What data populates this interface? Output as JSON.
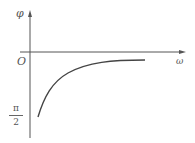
{
  "diagram": {
    "title": "",
    "y_axis_label": "φ",
    "x_axis_label": "ω",
    "origin_label": "O",
    "y_tick_label": {
      "numerator": "π",
      "denominator": "2"
    },
    "curve": {
      "description": "phase curve rising from -π/2 at small ω, asymptotically approaching 0 as ω increases",
      "start": {
        "omega": "≈0",
        "phi": "-π/2"
      },
      "asymptote_phi": 0
    },
    "colors": {
      "axis": "#555555",
      "curve": "#444444",
      "text": "#555555",
      "background": "#ffffff"
    }
  }
}
